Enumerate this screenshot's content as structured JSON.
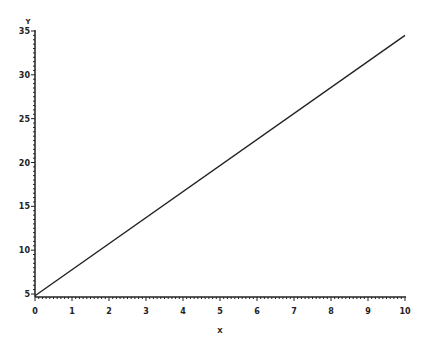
{
  "chart_data": {
    "type": "line",
    "title": "",
    "xlabel": "X",
    "ylabel": "Y",
    "xlim": [
      0,
      10
    ],
    "ylim": [
      5,
      35
    ],
    "grid": false,
    "legend": null,
    "x_ticks": [
      0,
      1,
      2,
      3,
      4,
      5,
      6,
      7,
      8,
      9,
      10
    ],
    "y_ticks": [
      5,
      10,
      15,
      20,
      25,
      30,
      35
    ],
    "series": [
      {
        "name": "line",
        "color": "#222222",
        "x": [
          0,
          10
        ],
        "y": [
          4.8,
          34.5
        ]
      }
    ]
  },
  "layout": {
    "plot_left": 35,
    "plot_right": 405,
    "plot_top": 31,
    "plot_bottom": 294,
    "x_axis_y": 297
  }
}
